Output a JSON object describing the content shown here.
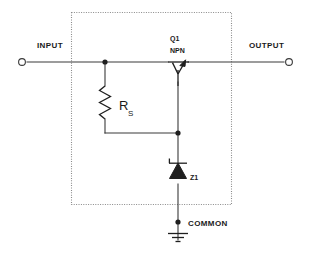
{
  "diagram": {
    "type": "electronic-schematic",
    "background_color": "#ffffff",
    "wire_color": "#3a3a3a",
    "component_color": "#1f1f1f",
    "boundary_color": "#8a8a8a",
    "boundary_style": "dotted"
  },
  "terminals": {
    "input": {
      "label": "INPUT",
      "symbol": "open-circle",
      "x": 22,
      "y": 62
    },
    "output": {
      "label": "OUTPUT",
      "symbol": "open-circle",
      "x": 289,
      "y": 62
    },
    "common": {
      "label": "COMMON",
      "symbol": "ground",
      "x": 178,
      "y": 222
    }
  },
  "components": [
    {
      "ref": "Q1",
      "type": "NPN",
      "kind": "transistor",
      "label_line1": "Q1",
      "label_line2": "NPN"
    },
    {
      "ref": "RS",
      "kind": "resistor",
      "label_main": "R",
      "label_sub": "S"
    },
    {
      "ref": "Z1",
      "kind": "zener-diode",
      "label_main": "Z1"
    }
  ],
  "nodes": [
    {
      "name": "input-node",
      "x": 105,
      "y": 62
    },
    {
      "name": "mid-node",
      "x": 178,
      "y": 133
    },
    {
      "name": "common-node",
      "x": 178,
      "y": 222
    }
  ]
}
